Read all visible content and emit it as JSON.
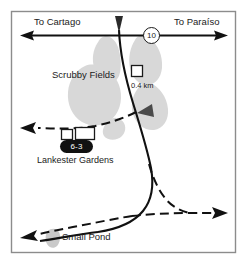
{
  "map": {
    "frame": {
      "border_color": "#8c8c8c",
      "background_color": "#ffffff"
    },
    "labels": {
      "to_cartago": "To Cartago",
      "to_paraiso": "To Paraíso",
      "scrubby_fields": "Scrubby Fields",
      "distance": "0.4 km",
      "lankester_gardens": "Lankester Gardens",
      "small_pond": "Small Pond"
    },
    "badges": {
      "route_number": "10",
      "park_code": "6-3"
    },
    "colors": {
      "road": "#111111",
      "trail": "#111111",
      "vegetation": "#d6d6d6",
      "water": "#c9c9c9",
      "badge_fill": "#111111",
      "badge_text": "#ffffff",
      "frame": "#8c8c8c"
    },
    "icons": {
      "route_shield": "route-shield-icon",
      "direction_marker_north": "triangle-marker-icon",
      "direction_marker_mid": "triangle-marker-icon",
      "building_small": "building-square-icon",
      "building_wide": "building-rect-icon",
      "pond": "pond-shape-icon",
      "arrow_west": "arrow-west-icon",
      "arrow_east": "arrow-east-icon",
      "trail_arrow_west": "dashed-arrow-west-icon",
      "trail_arrow_east": "dashed-arrow-east-icon"
    }
  }
}
